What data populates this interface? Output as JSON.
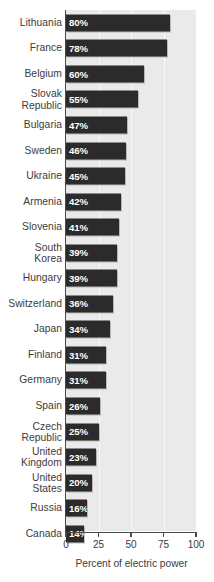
{
  "chart_data": {
    "type": "bar",
    "orientation": "horizontal",
    "title": "",
    "xlabel": "Percent of electric power",
    "ylabel": "",
    "xlim": [
      0,
      100
    ],
    "xticks": [
      "0",
      "25",
      "50",
      "75",
      "100"
    ],
    "xtick_values": [
      0,
      25,
      50,
      75,
      100
    ],
    "grid": true,
    "legend": null,
    "bar_color": "#2b2b2b",
    "plot_background": "#eaeaea",
    "value_suffix": "%",
    "categories": [
      "Lithuania",
      "France",
      "Belgium",
      "Slovak\nRepublic",
      "Bulgaria",
      "Sweden",
      "Ukraine",
      "Armenia",
      "Slovenia",
      "South\nKorea",
      "Hungary",
      "Switzerland",
      "Japan",
      "Finland",
      "Germany",
      "Spain",
      "Czech\nRepublic",
      "United\nKingdom",
      "United\nStates",
      "Russia",
      "Canada"
    ],
    "values": [
      80,
      78,
      60,
      55,
      47,
      46,
      45,
      42,
      41,
      39,
      39,
      36,
      34,
      31,
      31,
      26,
      25,
      23,
      20,
      16,
      14
    ],
    "value_labels": [
      "80%",
      "78%",
      "60%",
      "55%",
      "47%",
      "46%",
      "45%",
      "42%",
      "41%",
      "39%",
      "39%",
      "36%",
      "34%",
      "31%",
      "31%",
      "26%",
      "25%",
      "23%",
      "20%",
      "16%",
      "14%"
    ]
  }
}
